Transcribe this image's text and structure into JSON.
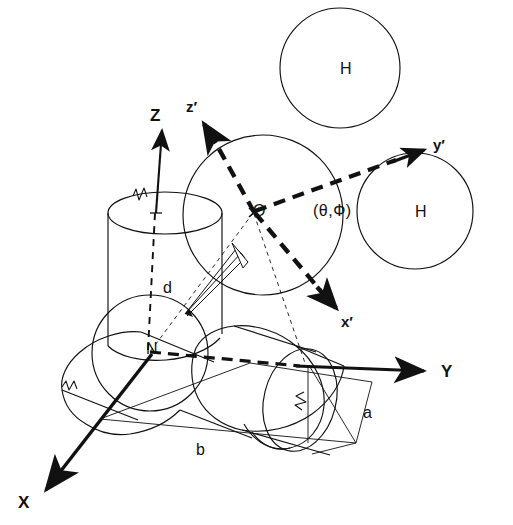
{
  "figure": {
    "kind": "3d-coordinate-frame-molecular-diagram",
    "background_color": "#ffffff",
    "stroke_color": "#111111"
  },
  "axes": {
    "lab_frame": {
      "name": "laboratory-frame",
      "items": [
        {
          "id": "Z",
          "label": "Z",
          "style": "solid",
          "label_x": 150,
          "label_y": 106
        },
        {
          "id": "Y",
          "label": "Y",
          "style": "solid",
          "label_x": 441,
          "label_y": 362
        },
        {
          "id": "X",
          "label": "X",
          "style": "solid",
          "label_x": 18,
          "label_y": 493
        }
      ]
    },
    "molecular_frame": {
      "name": "molecular-frame",
      "items": [
        {
          "id": "zprime",
          "label": "z′",
          "style": "dashed-bold",
          "label_x": 186,
          "label_y": 98
        },
        {
          "id": "yprime",
          "label": "y′",
          "style": "dashed-bold",
          "label_x": 433,
          "label_y": 136
        },
        {
          "id": "xprime",
          "label": "x′",
          "style": "dashed-bold",
          "label_x": 341,
          "label_y": 313
        }
      ]
    }
  },
  "points": [
    {
      "id": "origin",
      "label": "O",
      "x": 253,
      "y": 211
    },
    {
      "id": "node",
      "label": "N",
      "x": 146,
      "y": 349
    }
  ],
  "angles": {
    "label": "(θ,Ф)",
    "x": 313,
    "y": 211,
    "theta_symbol": "θ",
    "phi_symbol": "Ф"
  },
  "atoms": [
    {
      "id": "H-top",
      "label": "H",
      "cx": 340,
      "cy": 68,
      "r": 60
    },
    {
      "id": "H-right",
      "label": "H",
      "cx": 415,
      "cy": 211,
      "r": 58
    }
  ],
  "dimensions": [
    {
      "id": "d",
      "label": "d",
      "x": 163,
      "y": 288
    },
    {
      "id": "a",
      "label": "a",
      "x": 363,
      "y": 413
    },
    {
      "id": "b",
      "label": "b",
      "x": 196,
      "y": 450
    }
  ],
  "shapes": {
    "central_sphere": {
      "cx": 263,
      "cy": 215,
      "r": 80
    },
    "lower_left_sphere": {
      "cx": 150,
      "cy": 353,
      "r": 58
    },
    "vertical_cylinder": {
      "label": "vertical-cylinder"
    },
    "left_cylinder": {
      "label": "left-cylinder"
    },
    "right_cylinder": {
      "label": "right-cylinder"
    }
  }
}
